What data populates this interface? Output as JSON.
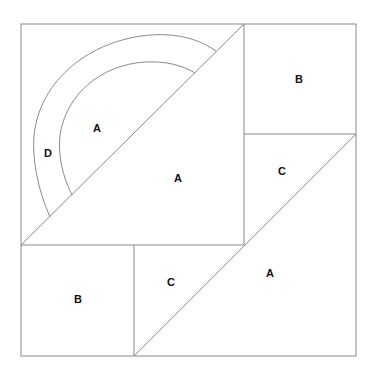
{
  "diagram": {
    "title": "",
    "stroke_color": "#8a8a8a",
    "labels": [
      {
        "id": "arc-inner-A",
        "text": "A",
        "x": 97,
        "y": 128
      },
      {
        "id": "arc-band-D",
        "text": "D",
        "x": 48,
        "y": 153
      },
      {
        "id": "big-triangle-A",
        "text": "A",
        "x": 178,
        "y": 178
      },
      {
        "id": "top-right-square-B",
        "text": "B",
        "x": 299,
        "y": 79
      },
      {
        "id": "right-triangle-C",
        "text": "C",
        "x": 282,
        "y": 171
      },
      {
        "id": "bottom-left-square-B",
        "text": "B",
        "x": 78,
        "y": 299
      },
      {
        "id": "bottom-triangle-C",
        "text": "C",
        "x": 171,
        "y": 282
      },
      {
        "id": "bottom-right-triangle-A",
        "text": "A",
        "x": 270,
        "y": 273
      }
    ]
  }
}
